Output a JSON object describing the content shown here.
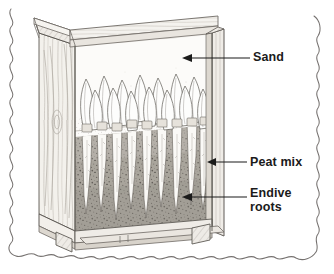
{
  "figure": {
    "kind": "line-drawing-diagram",
    "border_style": "wavy-scalloped-frame",
    "background_color": "#ffffff",
    "ink_color": "#4a4a4a",
    "text_color": "#1b1b1b"
  },
  "callouts": [
    {
      "id": "sand",
      "label": "Sand",
      "arrow_direction": "left",
      "points_to": "sand-layer"
    },
    {
      "id": "peat-mix",
      "label": "Peat mix",
      "arrow_direction": "left",
      "points_to": "peat-layer-edge"
    },
    {
      "id": "endive-roots",
      "label_line1": "Endive",
      "label_line2": "roots",
      "label": "Endive roots",
      "arrow_direction": "left",
      "points_to": "endive-root-mass"
    }
  ],
  "scene": {
    "crate": {
      "name": "wooden forcing crate",
      "material": "wood with visible grain",
      "wood_light": "#f4f2ee",
      "wood_mid": "#ddd8d0",
      "wood_line": "#6e6a64",
      "parts": [
        "top-rail-front",
        "top-rail-left",
        "left-side-panel",
        "right-corner-post",
        "bottom-rail",
        "base-skids",
        "feet"
      ]
    },
    "layers": [
      {
        "name": "sand",
        "fill": "#fbfaf8",
        "texture": "fine stipple",
        "position": "top layer inside crate"
      },
      {
        "name": "peat mix",
        "fill": "#a9a49c",
        "texture": "dark speckled",
        "position": "lower layer inside crate"
      }
    ],
    "plants": {
      "name": "endive",
      "chicon_count": 12,
      "chicon_color": "#fdfdfc",
      "root_count": 9,
      "root_color": "#fbfaf7",
      "description": "pointed white chicon heads above peat, tapering taproots below"
    }
  }
}
